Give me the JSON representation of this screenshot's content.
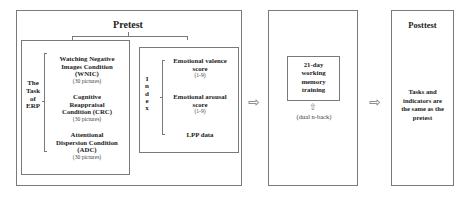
{
  "pretest": {
    "title": "Pretest",
    "task_label": [
      "The",
      "Task",
      "of",
      "ERP"
    ],
    "conditions": [
      {
        "name_lines": [
          "Watching Negative",
          "Images Condition",
          "(WNIC)"
        ],
        "note": "(30 pictures)"
      },
      {
        "name_lines": [
          "Cognitive",
          "Reappraisal",
          "Condition (CRC)"
        ],
        "note": "(30 pictures)"
      },
      {
        "name_lines": [
          "Attentional",
          "Dispersion Condition",
          "(ADC)"
        ],
        "note": "(30 pictures)"
      }
    ],
    "index_label": [
      "I",
      "n",
      "d",
      "e",
      "x"
    ],
    "indices": [
      {
        "name_lines": [
          "Emotional valence",
          "score"
        ],
        "note": "(1-9)"
      },
      {
        "name_lines": [
          "Emotional arousal",
          "score"
        ],
        "note": "(1-9)"
      },
      {
        "name_lines": [
          "LPP data"
        ],
        "note": ""
      }
    ]
  },
  "training": {
    "box_lines": [
      "21-day",
      "working",
      "memory",
      "training"
    ],
    "up_arrow": "⇧",
    "method": "(dual n-back)"
  },
  "posttest": {
    "title": "Posttest",
    "description_lines": [
      "Tasks and",
      "indicators are",
      "the same as the",
      "pretest"
    ]
  },
  "arrows": {
    "right_arrow": "⇨"
  }
}
